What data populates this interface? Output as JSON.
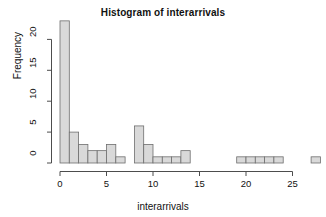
{
  "chart_data": {
    "type": "bar",
    "title": "Histogram of interarrivals",
    "xlabel": "interarrivals",
    "ylabel": "Frequency",
    "grid": false,
    "legend": null,
    "binwidth": 1,
    "xlim": [
      0,
      28
    ],
    "ylim": [
      0,
      23
    ],
    "xticks": [
      0,
      5,
      10,
      15,
      20,
      25
    ],
    "yticks": [
      0,
      5,
      10,
      15,
      20
    ],
    "bin_starts": [
      0,
      1,
      2,
      3,
      4,
      5,
      6,
      7,
      8,
      9,
      10,
      11,
      12,
      13,
      14,
      15,
      16,
      17,
      18,
      19,
      20,
      21,
      22,
      23,
      24,
      25,
      26,
      27
    ],
    "categories": [
      "0-1",
      "1-2",
      "2-3",
      "3-4",
      "4-5",
      "5-6",
      "6-7",
      "7-8",
      "8-9",
      "9-10",
      "10-11",
      "11-12",
      "12-13",
      "13-14",
      "14-15",
      "15-16",
      "16-17",
      "17-18",
      "18-19",
      "19-20",
      "20-21",
      "21-22",
      "22-23",
      "23-24",
      "24-25",
      "25-26",
      "26-27",
      "27-28"
    ],
    "values": [
      23,
      5,
      3,
      2,
      2,
      3,
      1,
      0,
      6,
      3,
      1,
      1,
      1,
      2,
      0,
      0,
      0,
      0,
      0,
      1,
      1,
      1,
      1,
      1,
      0,
      0,
      0,
      1
    ],
    "bar_color": "#d9d9d9",
    "bar_border_color": "#6e6e6e",
    "axis_color": "#4d4d4d"
  },
  "xtick_labels": [
    "0",
    "5",
    "10",
    "15",
    "20",
    "25"
  ],
  "ytick_labels": [
    "0",
    "5",
    "10",
    "15",
    "20"
  ]
}
